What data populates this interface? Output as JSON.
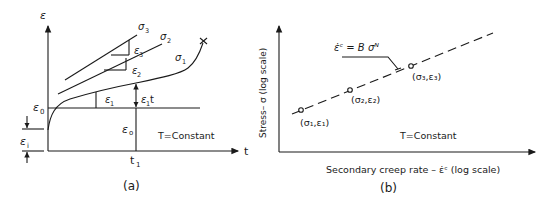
{
  "figure": {
    "panel_a": {
      "caption": "(a)",
      "y_axis_label": "ε",
      "x_axis_label": "t",
      "eps0_left_label": "ε",
      "eps0_left_sub": "0",
      "eps_i_label": "ε",
      "eps_i_sub": "i",
      "eps0_vertical_label": "ε",
      "eps0_vertical_sub": "o",
      "t1_label": "t",
      "t1_sub": "1",
      "condition": "T=Constant",
      "curves": [
        {
          "name": "σ",
          "sub": "1",
          "slope_label": "ε",
          "slope_sub": "1"
        },
        {
          "name": "σ",
          "sub": "2",
          "slope_label": "ε",
          "slope_sub": "2"
        },
        {
          "name": "σ",
          "sub": "3",
          "slope_label": "ε",
          "slope_sub": "3"
        }
      ],
      "increment_label": "ε",
      "increment_sub": "1",
      "increment_suffix": "t",
      "rupture_marker": "×"
    },
    "panel_b": {
      "caption": "(b)",
      "y_axis_label": "Stress– σ  (log scale)",
      "x_axis_label": "Secondary creep rate  – ε̇ᶜ (log scale)",
      "equation": "ε̇ᶜ = B σᴺ",
      "condition": "T=Constant",
      "points": [
        {
          "label": "(σ₁,ε₁)"
        },
        {
          "label": "(σ₂,ε₂)"
        },
        {
          "label": "(σ₃,ε₃)"
        }
      ]
    }
  }
}
